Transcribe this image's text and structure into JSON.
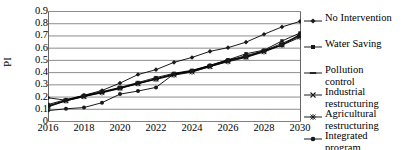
{
  "chart_data": {
    "type": "line",
    "title": "",
    "xlabel": "",
    "ylabel": "PI",
    "x": [
      2016,
      2017,
      2018,
      2019,
      2020,
      2021,
      2022,
      2023,
      2024,
      2025,
      2026,
      2027,
      2028,
      2029,
      2030
    ],
    "xtick_labels": [
      "2016",
      "2018",
      "2020",
      "2022",
      "2024",
      "2026",
      "2028",
      "2030"
    ],
    "xtick_values": [
      2016,
      2018,
      2020,
      2022,
      2024,
      2026,
      2028,
      2030
    ],
    "ytick_labels": [
      "0",
      "0.1",
      "0.2",
      "0.3",
      "0.4",
      "0.5",
      "0.6",
      "0.7",
      "0.8",
      "0.9"
    ],
    "ytick_values": [
      0,
      0.1,
      0.2,
      0.3,
      0.4,
      0.5,
      0.6,
      0.7,
      0.8,
      0.9
    ],
    "xlim": [
      2016,
      2030
    ],
    "ylim": [
      0,
      0.9
    ],
    "grid": "horizontal",
    "legend_position": "right",
    "series": [
      {
        "name": "No Intervention",
        "marker": "diamond",
        "color": "#000000",
        "values": [
          0.19,
          0.17,
          0.21,
          0.25,
          0.31,
          0.38,
          0.42,
          0.48,
          0.52,
          0.57,
          0.6,
          0.645,
          0.71,
          0.77,
          0.815
        ]
      },
      {
        "name": "Water Saving",
        "marker": "square",
        "color": "#000000",
        "values": [
          0.135,
          0.175,
          0.21,
          0.24,
          0.275,
          0.315,
          0.355,
          0.39,
          0.415,
          0.455,
          0.5,
          0.55,
          0.58,
          0.655,
          0.72
        ]
      },
      {
        "name": "Pollution control",
        "marker": "dash",
        "color": "#000000",
        "values": [
          0.125,
          0.17,
          0.205,
          0.235,
          0.27,
          0.31,
          0.345,
          0.385,
          0.41,
          0.45,
          0.495,
          0.535,
          0.575,
          0.635,
          0.7
        ]
      },
      {
        "name": "Industrial restructuring",
        "marker": "x",
        "color": "#000000",
        "values": [
          0.12,
          0.165,
          0.2,
          0.235,
          0.27,
          0.305,
          0.345,
          0.38,
          0.405,
          0.445,
          0.49,
          0.525,
          0.57,
          0.625,
          0.695
        ],
        "label_lines": [
          "Industrial",
          "restructuring"
        ]
      },
      {
        "name": "Agricultural restructuring",
        "marker": "star",
        "color": "#000000",
        "values": [
          0.115,
          0.165,
          0.2,
          0.23,
          0.265,
          0.305,
          0.34,
          0.375,
          0.4,
          0.445,
          0.485,
          0.52,
          0.565,
          0.62,
          0.685
        ],
        "label_lines": [
          "Agricultural",
          "restructuring"
        ]
      },
      {
        "name": "Integrated program",
        "marker": "circle",
        "color": "#000000",
        "values": [
          0.085,
          0.1,
          0.11,
          0.15,
          0.22,
          0.245,
          0.275,
          0.385,
          0.41,
          0.455,
          0.5,
          0.525,
          0.575,
          0.62,
          0.71
        ],
        "label_lines": [
          "Integrated",
          "program"
        ]
      }
    ]
  },
  "axes": {
    "y_title": "PI"
  },
  "legend": {
    "entries": [
      {
        "label": "No Intervention",
        "marker": "diamond",
        "lines": [
          "No Intervention"
        ]
      },
      {
        "label": "Water Saving",
        "marker": "square",
        "lines": [
          "Water Saving"
        ]
      },
      {
        "label": "Pollution control",
        "marker": "dash",
        "lines": [
          "Pollution",
          "control"
        ]
      },
      {
        "label": "Industrial restructuring",
        "marker": "x",
        "lines": [
          "Industrial",
          "restructuring"
        ]
      },
      {
        "label": "Agricultural restructuring",
        "marker": "star",
        "lines": [
          "Agricultural",
          "restructuring"
        ]
      },
      {
        "label": "Integrated program",
        "marker": "circle",
        "lines": [
          "Integrated",
          "program"
        ]
      }
    ]
  },
  "colors": {
    "line": "#1a1a1a",
    "grid": "#808080",
    "frame": "#666666",
    "text": "#000000"
  }
}
